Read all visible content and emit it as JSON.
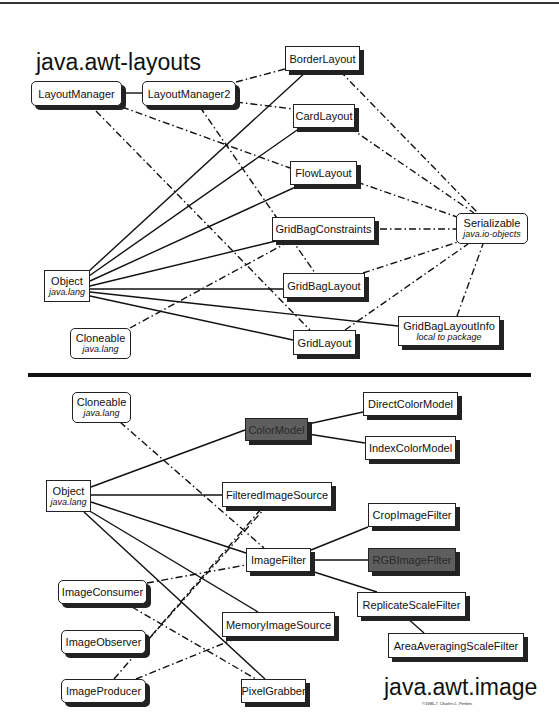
{
  "top_diagram": {
    "title": "java.awt-layouts",
    "nodes": {
      "layout_manager": {
        "label": "LayoutManager"
      },
      "layout_manager2": {
        "label": "LayoutManager2"
      },
      "border_layout": {
        "label": "BorderLayout"
      },
      "card_layout": {
        "label": "CardLayout"
      },
      "flow_layout": {
        "label": "FlowLayout"
      },
      "grid_bag_constraints": {
        "label": "GridBagConstraints"
      },
      "serializable": {
        "label": "Serializable",
        "sub": "java.io-objects"
      },
      "object": {
        "label": "Object",
        "sub": "java.lang"
      },
      "grid_bag_layout": {
        "label": "GridBagLayout"
      },
      "cloneable": {
        "label": "Cloneable",
        "sub": "java.lang"
      },
      "grid_bag_layout_info": {
        "label": "GridBagLayoutInfo",
        "sub": "local to package"
      },
      "grid_layout": {
        "label": "GridLayout"
      }
    },
    "edges": [
      {
        "from": "LayoutManager",
        "to": "LayoutManager2",
        "style": "solid"
      },
      {
        "from": "Object",
        "to": "BorderLayout",
        "style": "solid"
      },
      {
        "from": "Object",
        "to": "CardLayout",
        "style": "solid"
      },
      {
        "from": "Object",
        "to": "FlowLayout",
        "style": "solid"
      },
      {
        "from": "Object",
        "to": "GridBagConstraints",
        "style": "solid"
      },
      {
        "from": "Object",
        "to": "GridBagLayout",
        "style": "solid"
      },
      {
        "from": "Object",
        "to": "GridBagLayoutInfo",
        "style": "solid"
      },
      {
        "from": "Object",
        "to": "GridLayout",
        "style": "solid"
      },
      {
        "from": "LayoutManager2",
        "to": "BorderLayout",
        "style": "dash-dot"
      },
      {
        "from": "LayoutManager2",
        "to": "CardLayout",
        "style": "dash-dot"
      },
      {
        "from": "LayoutManager2",
        "to": "GridBagLayout",
        "style": "dash-dot"
      },
      {
        "from": "LayoutManager",
        "to": "FlowLayout",
        "style": "dash-dot"
      },
      {
        "from": "LayoutManager",
        "to": "GridLayout",
        "style": "dash-dot"
      },
      {
        "from": "Cloneable",
        "to": "GridBagConstraints",
        "style": "dash-dot"
      },
      {
        "from": "BorderLayout",
        "to": "Serializable",
        "style": "dash-dot"
      },
      {
        "from": "CardLayout",
        "to": "Serializable",
        "style": "dash-dot"
      },
      {
        "from": "FlowLayout",
        "to": "Serializable",
        "style": "dash-dot"
      },
      {
        "from": "GridBagConstraints",
        "to": "Serializable",
        "style": "dash-dot"
      },
      {
        "from": "GridBagLayout",
        "to": "Serializable",
        "style": "dash-dot"
      },
      {
        "from": "GridLayout",
        "to": "Serializable",
        "style": "dash-dot"
      },
      {
        "from": "GridBagLayoutInfo",
        "to": "Serializable",
        "style": "dash-dot"
      }
    ]
  },
  "bottom_diagram": {
    "title": "java.awt.image",
    "copyright": "©1995-7, Charles L. Perkins",
    "nodes": {
      "cloneable": {
        "label": "Cloneable",
        "sub": "java.lang"
      },
      "color_model": {
        "label": "ColorModel"
      },
      "direct_color_model": {
        "label": "DirectColorModel"
      },
      "index_color_model": {
        "label": "IndexColorModel"
      },
      "object": {
        "label": "Object",
        "sub": "java.lang"
      },
      "filtered_image_source": {
        "label": "FilteredImageSource"
      },
      "crop_image_filter": {
        "label": "CropImageFilter"
      },
      "image_filter": {
        "label": "ImageFilter"
      },
      "rgb_image_filter": {
        "label": "RGBImageFilter"
      },
      "image_consumer": {
        "label": "ImageConsumer"
      },
      "replicate_scale_filter": {
        "label": "ReplicateScaleFilter"
      },
      "memory_image_source": {
        "label": "MemoryImageSource"
      },
      "image_observer": {
        "label": "ImageObserver"
      },
      "area_averaging_scale_filter": {
        "label": "AreaAveragingScaleFilter"
      },
      "image_producer": {
        "label": "ImageProducer"
      },
      "pixel_grabber": {
        "label": "PixelGrabber"
      }
    },
    "edges": [
      {
        "from": "Object",
        "to": "ColorModel",
        "style": "solid"
      },
      {
        "from": "ColorModel",
        "to": "DirectColorModel",
        "style": "solid"
      },
      {
        "from": "ColorModel",
        "to": "IndexColorModel",
        "style": "solid"
      },
      {
        "from": "Object",
        "to": "FilteredImageSource",
        "style": "solid"
      },
      {
        "from": "Object",
        "to": "ImageFilter",
        "style": "solid"
      },
      {
        "from": "Object",
        "to": "MemoryImageSource",
        "style": "solid"
      },
      {
        "from": "Object",
        "to": "PixelGrabber",
        "style": "solid"
      },
      {
        "from": "ImageFilter",
        "to": "CropImageFilter",
        "style": "solid"
      },
      {
        "from": "ImageFilter",
        "to": "RGBImageFilter",
        "style": "solid"
      },
      {
        "from": "ImageFilter",
        "to": "ReplicateScaleFilter",
        "style": "solid"
      },
      {
        "from": "ReplicateScaleFilter",
        "to": "AreaAveragingScaleFilter",
        "style": "solid"
      },
      {
        "from": "Cloneable",
        "to": "ImageFilter",
        "style": "dash-dot"
      },
      {
        "from": "ImageConsumer",
        "to": "ImageFilter",
        "style": "dash-dot"
      },
      {
        "from": "ImageConsumer",
        "to": "PixelGrabber",
        "style": "dash-dot"
      },
      {
        "from": "ImageProducer",
        "to": "FilteredImageSource",
        "style": "dash-dot"
      },
      {
        "from": "ImageProducer",
        "to": "MemoryImageSource",
        "style": "dash-dot"
      },
      {
        "from": "ImageObserver",
        "to": "FilteredImageSource",
        "style": "dash-dot"
      }
    ]
  }
}
